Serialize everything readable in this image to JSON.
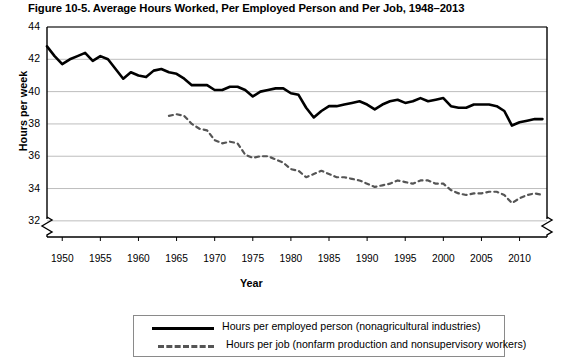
{
  "figure": {
    "title": "Figure 10-5. Average Hours Worked, Per Employed Person and Per Job, 1948–2013"
  },
  "axes": {
    "ylabel": "Hours per week",
    "xlabel": "Year",
    "yticks": [
      32,
      34,
      36,
      38,
      40,
      42,
      44
    ],
    "xticks": [
      1950,
      1955,
      1960,
      1965,
      1970,
      1975,
      1980,
      1985,
      1990,
      1995,
      2000,
      2005,
      2010
    ],
    "y_axis_break": true,
    "x_axis_break": true
  },
  "legend": {
    "items": [
      {
        "key": "solid-line-key",
        "label": "Hours per employed person (nonagricultural industries)"
      },
      {
        "key": "dashed-line-key",
        "label": "Hours per job (nonfarm production and nonsupervisory workers)"
      }
    ]
  },
  "colors": {
    "series_solid": "#000000",
    "series_dashed": "#555555",
    "grid": "#bdbdbd",
    "axis": "#000000"
  },
  "chart_data": {
    "type": "line",
    "title": "Figure 10-5. Average Hours Worked, Per Employed Person and Per Job, 1948–2013",
    "xlabel": "Year",
    "ylabel": "Hours per week",
    "xlim": [
      1948,
      2013
    ],
    "ylim": [
      31,
      44
    ],
    "grid": true,
    "legend_position": "below",
    "series": [
      {
        "name": "Hours per employed person (nonagricultural industries)",
        "style": "solid",
        "x": [
          1948,
          1949,
          1950,
          1951,
          1952,
          1953,
          1954,
          1955,
          1956,
          1957,
          1958,
          1959,
          1960,
          1961,
          1962,
          1963,
          1964,
          1965,
          1966,
          1967,
          1968,
          1969,
          1970,
          1971,
          1972,
          1973,
          1974,
          1975,
          1976,
          1977,
          1978,
          1979,
          1980,
          1981,
          1982,
          1983,
          1984,
          1985,
          1986,
          1987,
          1988,
          1989,
          1990,
          1991,
          1992,
          1993,
          1994,
          1995,
          1996,
          1997,
          1998,
          1999,
          2000,
          2001,
          2002,
          2003,
          2004,
          2005,
          2006,
          2007,
          2008,
          2009,
          2010,
          2011,
          2012,
          2013
        ],
        "values": [
          42.8,
          42.2,
          41.7,
          42.0,
          42.2,
          42.4,
          41.9,
          42.2,
          42.0,
          41.4,
          40.8,
          41.2,
          41.0,
          40.9,
          41.3,
          41.4,
          41.2,
          41.1,
          40.8,
          40.4,
          40.4,
          40.4,
          40.1,
          40.1,
          40.3,
          40.3,
          40.1,
          39.7,
          40.0,
          40.1,
          40.2,
          40.2,
          39.9,
          39.8,
          39.0,
          38.4,
          38.8,
          39.1,
          39.1,
          39.2,
          39.3,
          39.4,
          39.2,
          38.9,
          39.2,
          39.4,
          39.5,
          39.3,
          39.4,
          39.6,
          39.4,
          39.5,
          39.6,
          39.1,
          39.0,
          39.0,
          39.2,
          39.2,
          39.2,
          39.1,
          38.8,
          37.9,
          38.1,
          38.2,
          38.3,
          38.3
        ]
      },
      {
        "name": "Hours per job (nonfarm production and nonsupervisory workers)",
        "style": "dashed",
        "x": [
          1964,
          1965,
          1966,
          1967,
          1968,
          1969,
          1970,
          1971,
          1972,
          1973,
          1974,
          1975,
          1976,
          1977,
          1978,
          1979,
          1980,
          1981,
          1982,
          1983,
          1984,
          1985,
          1986,
          1987,
          1988,
          1989,
          1990,
          1991,
          1992,
          1993,
          1994,
          1995,
          1996,
          1997,
          1998,
          1999,
          2000,
          2001,
          2002,
          2003,
          2004,
          2005,
          2006,
          2007,
          2008,
          2009,
          2010,
          2011,
          2012,
          2013
        ],
        "values": [
          38.5,
          38.6,
          38.5,
          38.0,
          37.7,
          37.6,
          37.0,
          36.8,
          36.9,
          36.8,
          36.1,
          35.9,
          36.0,
          36.0,
          35.8,
          35.6,
          35.2,
          35.1,
          34.7,
          34.9,
          35.1,
          34.9,
          34.7,
          34.7,
          34.6,
          34.5,
          34.3,
          34.1,
          34.2,
          34.3,
          34.5,
          34.4,
          34.3,
          34.5,
          34.5,
          34.3,
          34.3,
          33.9,
          33.7,
          33.6,
          33.7,
          33.7,
          33.8,
          33.8,
          33.6,
          33.1,
          33.4,
          33.6,
          33.7,
          33.6
        ]
      }
    ]
  }
}
